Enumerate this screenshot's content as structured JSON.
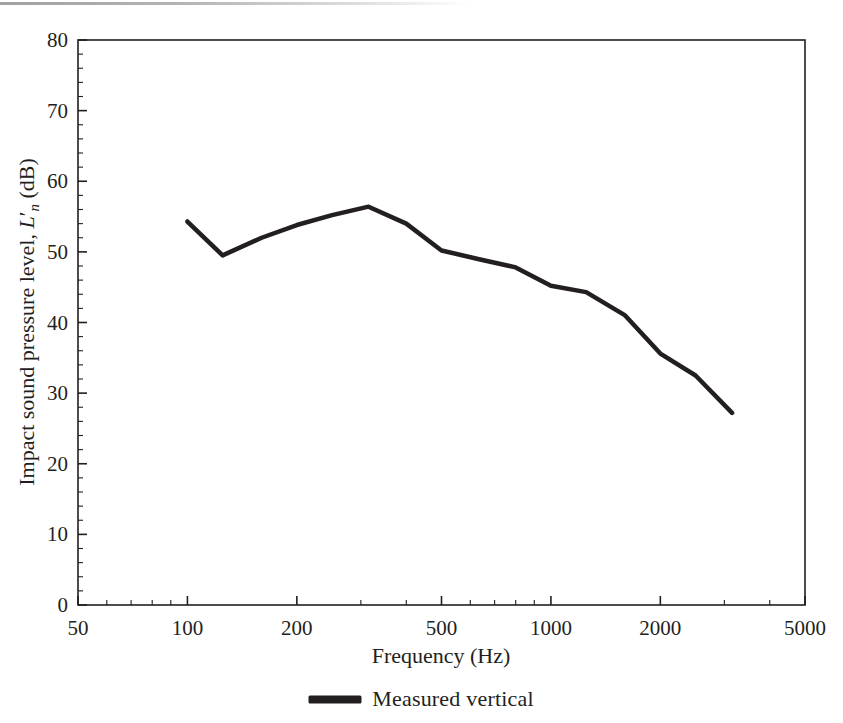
{
  "figure": {
    "background_color": "#ffffff",
    "ink_color": "#231f20"
  },
  "chart_data": {
    "type": "line",
    "title": "",
    "xlabel": "Frequency (Hz)",
    "ylabel": "Impact sound pressure level, L'n (dB)",
    "ylabel_parts": {
      "lead": "Impact sound pressure level, ",
      "symbol": "L",
      "prime": "′",
      "subscript": "n",
      "tail": " (dB)"
    },
    "xscale": "log",
    "yscale": "linear",
    "xlim": [
      50,
      5000
    ],
    "ylim": [
      0,
      80
    ],
    "xticks": [
      50,
      100,
      200,
      500,
      1000,
      2000,
      5000
    ],
    "xtick_labels": [
      "50",
      "100",
      "200",
      "500",
      "1000",
      "2000",
      "5000"
    ],
    "yticks": [
      0,
      10,
      20,
      30,
      40,
      50,
      60,
      70,
      80
    ],
    "ytick_labels": [
      "0",
      "10",
      "20",
      "30",
      "40",
      "50",
      "60",
      "70",
      "80"
    ],
    "y_minor_tick_step": 2,
    "grid": false,
    "legend_position": "below-axes",
    "series": [
      {
        "name": "Measured vertical",
        "color": "#231f20",
        "linewidth": 4.5,
        "x": [
          100,
          125,
          160,
          200,
          250,
          315,
          400,
          500,
          630,
          800,
          1000,
          1250,
          1600,
          2000,
          2500,
          3150
        ],
        "values": [
          54.3,
          49.5,
          52.0,
          53.8,
          55.2,
          56.4,
          54.0,
          50.2,
          49.0,
          47.8,
          45.2,
          44.3,
          41.0,
          35.6,
          32.5,
          27.2
        ]
      }
    ]
  },
  "legend": {
    "entries": [
      {
        "label": "Measured vertical",
        "color": "#231f20"
      }
    ]
  }
}
